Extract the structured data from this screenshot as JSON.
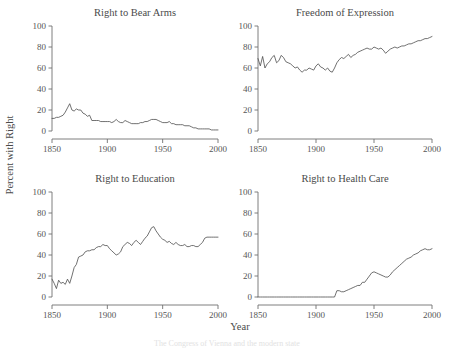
{
  "figure": {
    "xlabel": "Year",
    "ylabel": "Percent with Right",
    "ylim": [
      0,
      100
    ],
    "xlim": [
      1850,
      2000
    ],
    "yticks": [
      0,
      20,
      40,
      60,
      80,
      100
    ],
    "xticks": [
      1850,
      1900,
      1950,
      2000
    ],
    "grid": false,
    "line_color": "#4d4d4d",
    "axis_color": "#6f6f6f"
  },
  "chart_data": [
    {
      "type": "line",
      "title": "Right to Bear Arms",
      "xlabel": "Year",
      "ylabel": "Percent with Right",
      "xlim": [
        1850,
        2000
      ],
      "ylim": [
        0,
        100
      ],
      "xticks": [
        1850,
        1900,
        1950,
        2000
      ],
      "yticks": [
        0,
        20,
        40,
        60,
        80,
        100
      ],
      "x": [
        1850,
        1852,
        1854,
        1856,
        1858,
        1860,
        1862,
        1864,
        1866,
        1868,
        1870,
        1872,
        1874,
        1876,
        1878,
        1880,
        1882,
        1884,
        1886,
        1888,
        1890,
        1892,
        1894,
        1896,
        1898,
        1900,
        1902,
        1904,
        1906,
        1908,
        1910,
        1912,
        1914,
        1916,
        1918,
        1920,
        1922,
        1924,
        1926,
        1928,
        1930,
        1932,
        1934,
        1936,
        1938,
        1940,
        1942,
        1944,
        1946,
        1948,
        1950,
        1952,
        1954,
        1956,
        1958,
        1960,
        1962,
        1964,
        1966,
        1968,
        1970,
        1972,
        1974,
        1976,
        1978,
        1980,
        1982,
        1984,
        1986,
        1988,
        1990,
        1992,
        1994,
        1996,
        1998,
        2000
      ],
      "values": [
        12,
        12,
        13,
        13,
        14,
        15,
        18,
        22,
        26,
        20,
        19,
        21,
        20,
        20,
        17,
        16,
        14,
        15,
        10,
        10,
        10,
        10,
        9,
        9,
        9,
        9,
        9,
        8,
        9,
        11,
        9,
        8,
        8,
        10,
        9,
        8,
        7,
        7,
        7,
        7,
        8,
        8,
        9,
        9,
        10,
        11,
        11,
        11,
        10,
        9,
        8,
        8,
        8,
        9,
        7,
        7,
        6,
        6,
        6,
        6,
        5,
        5,
        5,
        4,
        3,
        3,
        2,
        2,
        2,
        2,
        2,
        2,
        1,
        1,
        1,
        1
      ]
    },
    {
      "type": "line",
      "title": "Freedom of Expression",
      "xlabel": "Year",
      "ylabel": "Percent with Right",
      "xlim": [
        1850,
        2000
      ],
      "ylim": [
        0,
        100
      ],
      "xticks": [
        1850,
        1900,
        1950,
        2000
      ],
      "yticks": [
        0,
        20,
        40,
        60,
        80,
        100
      ],
      "x": [
        1850,
        1852,
        1854,
        1856,
        1858,
        1860,
        1862,
        1864,
        1866,
        1868,
        1870,
        1872,
        1874,
        1876,
        1878,
        1880,
        1882,
        1884,
        1886,
        1888,
        1890,
        1892,
        1894,
        1896,
        1898,
        1900,
        1902,
        1904,
        1906,
        1908,
        1910,
        1912,
        1914,
        1916,
        1918,
        1920,
        1922,
        1924,
        1926,
        1928,
        1930,
        1932,
        1934,
        1936,
        1938,
        1940,
        1942,
        1944,
        1946,
        1948,
        1950,
        1952,
        1954,
        1956,
        1958,
        1960,
        1962,
        1964,
        1966,
        1968,
        1970,
        1972,
        1974,
        1976,
        1978,
        1980,
        1982,
        1984,
        1986,
        1988,
        1990,
        1992,
        1994,
        1996,
        1998,
        2000
      ],
      "values": [
        69,
        62,
        71,
        60,
        64,
        66,
        70,
        72,
        65,
        67,
        72,
        70,
        66,
        65,
        64,
        62,
        60,
        61,
        58,
        56,
        58,
        58,
        60,
        59,
        58,
        62,
        64,
        61,
        60,
        58,
        60,
        57,
        56,
        60,
        65,
        68,
        70,
        69,
        71,
        73,
        70,
        72,
        73,
        75,
        76,
        77,
        78,
        79,
        78,
        78,
        80,
        79,
        78,
        79,
        77,
        74,
        76,
        78,
        79,
        80,
        79,
        80,
        81,
        81,
        82,
        83,
        83,
        84,
        85,
        86,
        86,
        87,
        88,
        88,
        89,
        90
      ]
    },
    {
      "type": "line",
      "title": "Right to Education",
      "xlabel": "Year",
      "ylabel": "Percent with Right",
      "xlim": [
        1850,
        2000
      ],
      "ylim": [
        0,
        100
      ],
      "xticks": [
        1850,
        1900,
        1950,
        2000
      ],
      "yticks": [
        0,
        20,
        40,
        60,
        80,
        100
      ],
      "x": [
        1850,
        1852,
        1854,
        1856,
        1858,
        1860,
        1862,
        1864,
        1866,
        1868,
        1870,
        1872,
        1874,
        1876,
        1878,
        1880,
        1882,
        1884,
        1886,
        1888,
        1890,
        1892,
        1894,
        1896,
        1898,
        1900,
        1902,
        1904,
        1906,
        1908,
        1910,
        1912,
        1914,
        1916,
        1918,
        1920,
        1922,
        1924,
        1926,
        1928,
        1930,
        1932,
        1934,
        1936,
        1938,
        1940,
        1942,
        1944,
        1946,
        1948,
        1950,
        1952,
        1954,
        1956,
        1958,
        1960,
        1962,
        1964,
        1966,
        1968,
        1970,
        1972,
        1974,
        1976,
        1978,
        1980,
        1982,
        1984,
        1986,
        1988,
        1990,
        1992,
        1994,
        1996,
        1998,
        2000
      ],
      "values": [
        17,
        13,
        8,
        16,
        13,
        14,
        12,
        17,
        13,
        20,
        28,
        31,
        38,
        39,
        40,
        43,
        44,
        44,
        45,
        45,
        47,
        48,
        48,
        50,
        49,
        49,
        46,
        44,
        42,
        40,
        41,
        43,
        48,
        50,
        52,
        51,
        49,
        52,
        54,
        52,
        50,
        53,
        56,
        58,
        62,
        66,
        67,
        63,
        60,
        57,
        55,
        54,
        52,
        53,
        51,
        50,
        52,
        50,
        49,
        49,
        50,
        48,
        48,
        49,
        49,
        48,
        48,
        50,
        52,
        56,
        57,
        57,
        57,
        57,
        57,
        57
      ]
    },
    {
      "type": "line",
      "title": "Right to Health Care",
      "xlabel": "Year",
      "ylabel": "Percent with Right",
      "xlim": [
        1850,
        2000
      ],
      "ylim": [
        0,
        100
      ],
      "xticks": [
        1850,
        1900,
        1950,
        2000
      ],
      "yticks": [
        0,
        20,
        40,
        60,
        80,
        100
      ],
      "x": [
        1850,
        1852,
        1854,
        1856,
        1858,
        1860,
        1862,
        1864,
        1866,
        1868,
        1870,
        1872,
        1874,
        1876,
        1878,
        1880,
        1882,
        1884,
        1886,
        1888,
        1890,
        1892,
        1894,
        1896,
        1898,
        1900,
        1902,
        1904,
        1906,
        1908,
        1910,
        1912,
        1914,
        1916,
        1918,
        1920,
        1922,
        1924,
        1926,
        1928,
        1930,
        1932,
        1934,
        1936,
        1938,
        1940,
        1942,
        1944,
        1946,
        1948,
        1950,
        1952,
        1954,
        1956,
        1958,
        1960,
        1962,
        1964,
        1966,
        1968,
        1970,
        1972,
        1974,
        1976,
        1978,
        1980,
        1982,
        1984,
        1986,
        1988,
        1990,
        1992,
        1994,
        1996,
        1998,
        2000
      ],
      "values": [
        0,
        0,
        0,
        0,
        0,
        0,
        0,
        0,
        0,
        0,
        0,
        0,
        0,
        0,
        0,
        0,
        0,
        0,
        0,
        0,
        0,
        0,
        0,
        0,
        0,
        0,
        0,
        0,
        0,
        0,
        0,
        0,
        0,
        0,
        6,
        6,
        5,
        5,
        6,
        7,
        8,
        9,
        10,
        11,
        11,
        14,
        14,
        17,
        20,
        23,
        24,
        23,
        22,
        21,
        20,
        19,
        19,
        21,
        24,
        26,
        28,
        30,
        32,
        34,
        36,
        37,
        38,
        40,
        41,
        42,
        44,
        45,
        46,
        45,
        45,
        46
      ]
    }
  ]
}
